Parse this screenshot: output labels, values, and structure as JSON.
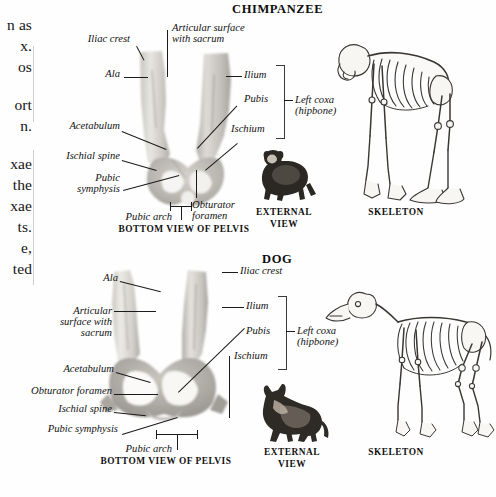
{
  "figure": {
    "type": "comparative-anatomy-plate",
    "background_color": "#fefefe",
    "ink_color": "#111111"
  },
  "body_text_column": {
    "note": "partially cropped text column at left edge of page",
    "lines": [
      "n as",
      "x.",
      "os",
      "ort",
      "n.",
      "xae",
      "the",
      "xae",
      "ts.",
      "e,",
      "ted"
    ]
  },
  "panels": [
    {
      "id": "chimpanzee",
      "heading": "CHIMPANZEE",
      "pelvis_caption": "BOTTOM VIEW OF PELVIS",
      "external_caption_line1": "EXTERNAL",
      "external_caption_line2": "VIEW",
      "skeleton_caption": "SKELETON",
      "bracket_label_line1": "Left coxa",
      "bracket_label_line2": "(hipbone)",
      "labels": [
        "Iliac crest",
        "Articular surface",
        "with sacrum",
        "Ala",
        "Ilium",
        "Pubis",
        "Ischium",
        "Acetabulum",
        "Ischial spine",
        "Pubic",
        "symphysis",
        "Pubic arch",
        "Obturator",
        "foramen"
      ],
      "bracket_items": [
        "Ilium",
        "Pubis",
        "Ischium"
      ]
    },
    {
      "id": "dog",
      "heading": "DOG",
      "pelvis_caption": "BOTTOM VIEW OF PELVIS",
      "external_caption_line1": "EXTERNAL",
      "external_caption_line2": "VIEW",
      "skeleton_caption": "SKELETON",
      "bracket_label_line1": "Left coxa",
      "bracket_label_line2": "(hipbone)",
      "labels": [
        "Ala",
        "Iliac crest",
        "Articular",
        "surface with",
        "sacrum",
        "Ilium",
        "Pubis",
        "Ischium",
        "Acetabulum",
        "Obturator foramen",
        "Ischial spine",
        "Pubic symphysis",
        "Pubic arch"
      ],
      "bracket_items": [
        "Ilium",
        "Pubis",
        "Ischium"
      ]
    }
  ]
}
